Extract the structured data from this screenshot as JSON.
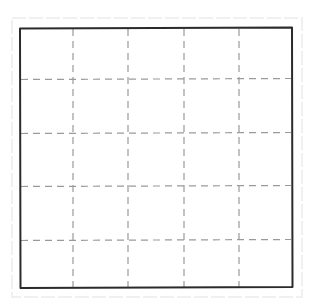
{
  "diagram": {
    "type": "grid",
    "style": "hand-drawn",
    "rows": 5,
    "columns": 5,
    "colors": {
      "background": "#ffffff",
      "border": "#2b2b2b",
      "grid_lines": "#9a9a9a",
      "outer_frame": "#ececec"
    },
    "outer_frame": {
      "x": 12,
      "y": 18,
      "width": 290,
      "height": 279
    },
    "border": {
      "x": 20,
      "y": 28,
      "width": 272,
      "height": 260
    },
    "vertical_lines_x": [
      73,
      128,
      184,
      239
    ],
    "horizontal_lines_y": [
      79,
      133,
      186,
      240
    ]
  }
}
